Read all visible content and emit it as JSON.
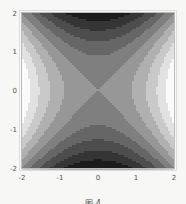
{
  "chart_data": {
    "type": "heatmap",
    "title": "",
    "function": "x^2 - y^2",
    "xlabel": "",
    "ylabel": "",
    "xlim": [
      -2,
      2
    ],
    "ylim": [
      -2,
      2
    ],
    "x_ticks": [
      "-2",
      "-1",
      "0",
      "1",
      "2"
    ],
    "y_ticks": [
      "-2",
      "-1",
      "0",
      "1",
      "2"
    ],
    "contour_levels": 10,
    "colormap": "grayscale (dark = low, light = high)",
    "grid": false,
    "legend": null
  },
  "caption": "图 4"
}
